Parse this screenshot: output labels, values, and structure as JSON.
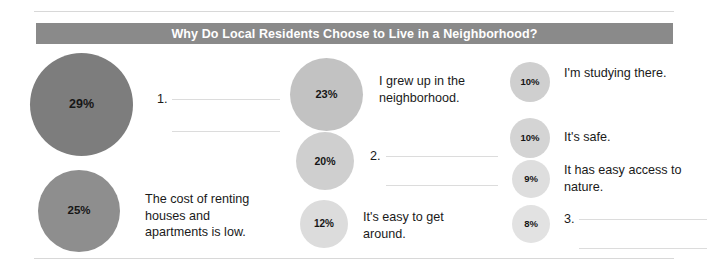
{
  "chart_data": {
    "type": "pie",
    "title": "Why Do Local Residents Choose to Live in a Neighborhood?",
    "xlabel": "",
    "ylabel": "",
    "legend_position": "inline",
    "categories": [
      "(blank 1)",
      "The cost of renting houses and apartments is low.",
      "I grew up in the neighborhood.",
      "(blank 2)",
      "It's easy to get around.",
      "I'm studying there.",
      "It's safe.",
      "It has easy access to nature.",
      "(blank 3)"
    ],
    "values": [
      29,
      25,
      23,
      20,
      12,
      10,
      10,
      9,
      8
    ],
    "unit": "%"
  },
  "header": {
    "title": "Why Do Local Residents Choose to Live in a Neighborhood?"
  },
  "columns": [
    {
      "items": [
        {
          "value": "29%",
          "number": "1.",
          "label": "",
          "blank": true
        },
        {
          "value": "25%",
          "number": "",
          "label": "The cost of renting houses and apartments is low.",
          "blank": false
        }
      ]
    },
    {
      "items": [
        {
          "value": "23%",
          "number": "",
          "label": "I grew up in the neighborhood.",
          "blank": false
        },
        {
          "value": "20%",
          "number": "2.",
          "label": "",
          "blank": true
        },
        {
          "value": "12%",
          "number": "",
          "label": "It's easy to get around.",
          "blank": false
        }
      ]
    },
    {
      "items": [
        {
          "value": "10%",
          "number": "",
          "label": "I'm studying there.",
          "blank": false
        },
        {
          "value": "10%",
          "number": "",
          "label": "It's safe.",
          "blank": false
        },
        {
          "value": "9%",
          "number": "",
          "label": "It has easy access to nature.",
          "blank": false
        },
        {
          "value": "8%",
          "number": "3.",
          "label": "",
          "blank": true
        }
      ]
    }
  ],
  "colors": {
    "banner": "#8a8a8a",
    "banner_text": "#ffffff",
    "bubble_largest": "#7d7d7d",
    "bubble_smallest": "#e2e2e2",
    "rule": "#d8d8d8",
    "blank_line": "#dcdcdc"
  }
}
